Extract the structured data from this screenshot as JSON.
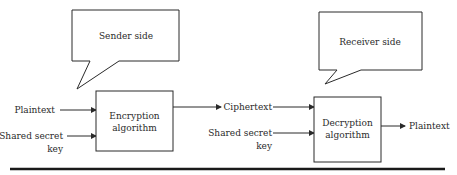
{
  "diagram": {
    "type": "symmetric-encryption-flow",
    "colors": {
      "stroke": "#2a2a2a",
      "text": "#2a2a2a",
      "background": "#ffffff",
      "rule": "#1a1a1a"
    },
    "sender": {
      "callout": "Sender side",
      "inputs": [
        "Plaintext",
        "Shared secret",
        "key"
      ],
      "box_line1": "Encryption",
      "box_line2": "algorithm"
    },
    "channel": {
      "label": "Ciphertext"
    },
    "receiver": {
      "callout": "Receiver side",
      "key_line1": "Shared secret",
      "key_line2": "key",
      "box_line1": "Decryption",
      "box_line2": "algorithm",
      "output": "Plaintext"
    }
  }
}
